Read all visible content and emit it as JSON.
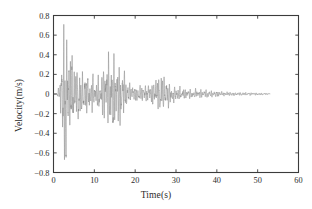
{
  "chart_data": {
    "type": "line",
    "title": "",
    "subtitle": "",
    "xlabel": "Time(s)",
    "ylabel": "Velocity(m/s)",
    "xlim": [
      0,
      60
    ],
    "ylim": [
      -0.8,
      0.8
    ],
    "xticks": [
      0,
      10,
      20,
      30,
      40,
      50,
      60
    ],
    "xtick_labels": [
      "0",
      "10",
      "20",
      "30",
      "40",
      "50",
      "60"
    ],
    "yticks": [
      -0.8,
      -0.6,
      -0.4,
      -0.2,
      0,
      0.2,
      0.4,
      0.6,
      0.8
    ],
    "ytick_labels": [
      "-0.8",
      "-0.6",
      "-0.4",
      "-0.2",
      "0",
      "0.2",
      "0.4",
      "0.6",
      "0.8"
    ],
    "grid": false,
    "legend": null,
    "legend_position": "none",
    "line_color": "#8c8c8c",
    "line_width": 0.55,
    "axis_color": "#3b3b3b",
    "background_color": "#ffffff",
    "annotations": [],
    "series": [
      {
        "name": "ground velocity",
        "description": "Seismic ground-velocity time history: quiet until about t=1 s, an intense first burst between t=2 and t=6 s peaking near +0.71 and -0.67 m/s, sustained strong shaking to t=10 s, a second burst between t=12 and t=18 s reaching about +0.40 and -0.40 m/s, then progressive decay through t=20-32 s with a moderate resurgence near t=25-28 s (about +0.17 / -0.18 m/s), low-level coda from t=32 to t=53 s, and no record beyond t=53 s.",
        "sample_rate_hz": 50,
        "t_start": 0,
        "t_end": 53,
        "peak_positive": 0.71,
        "peak_positive_time": 2.6,
        "peak_negative": -0.67,
        "peak_negative_time": 3.1,
        "envelope_times": [
          0,
          0.8,
          1.4,
          2.0,
          2.6,
          3.2,
          3.8,
          4.4,
          5.0,
          5.6,
          6.2,
          7.0,
          7.8,
          8.6,
          9.4,
          10.2,
          11.0,
          11.8,
          12.4,
          13.0,
          13.6,
          14.2,
          14.8,
          15.4,
          16.0,
          16.6,
          17.2,
          17.8,
          18.4,
          19.2,
          20.0,
          21.0,
          22.0,
          23.0,
          24.0,
          25.0,
          26.0,
          27.0,
          28.0,
          29.0,
          30.0,
          31.0,
          32.0,
          33.5,
          35.0,
          36.5,
          38.0,
          40.0,
          42.0,
          44.0,
          46.0,
          48.0,
          50.0,
          51.5,
          53.0
        ],
        "envelope_amplitude": [
          0.0,
          0.03,
          0.07,
          0.33,
          0.71,
          0.62,
          0.45,
          0.4,
          0.33,
          0.25,
          0.3,
          0.2,
          0.22,
          0.16,
          0.2,
          0.14,
          0.17,
          0.22,
          0.3,
          0.36,
          0.4,
          0.38,
          0.4,
          0.36,
          0.33,
          0.3,
          0.26,
          0.18,
          0.1,
          0.08,
          0.09,
          0.08,
          0.09,
          0.08,
          0.1,
          0.16,
          0.18,
          0.17,
          0.12,
          0.09,
          0.08,
          0.07,
          0.06,
          0.05,
          0.045,
          0.04,
          0.035,
          0.03,
          0.022,
          0.018,
          0.016,
          0.014,
          0.012,
          0.01,
          0.006
        ]
      }
    ]
  }
}
